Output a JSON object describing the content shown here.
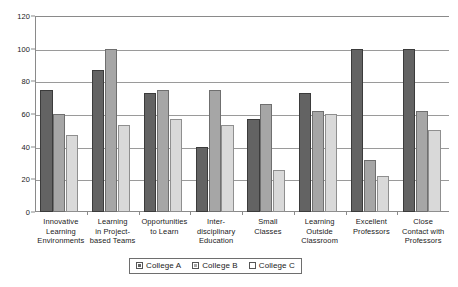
{
  "chart_data": {
    "type": "bar",
    "title": "",
    "subtitle": "",
    "xlabel": "",
    "ylabel": "",
    "ylim": [
      0,
      120
    ],
    "yticks": [
      0,
      20,
      40,
      60,
      80,
      100,
      120
    ],
    "grid": true,
    "legend_position": "bottom",
    "categories": [
      "Innovative Learning Environments",
      "Learning in Project-based Teams",
      "Opportunities to Learn",
      "Inter-disciplinary Education",
      "Small Classes",
      "Learning Outside Classroom",
      "Excellent Professors",
      "Close Contact with Professors"
    ],
    "category_lines": [
      [
        "Innovative",
        "Learning",
        "Environments"
      ],
      [
        "Learning",
        "in Project-",
        "based Teams"
      ],
      [
        "Opportunities",
        "to Learn"
      ],
      [
        "Inter-",
        "disciplinary",
        "Education"
      ],
      [
        "Small",
        "Classes"
      ],
      [
        "Learning",
        "Outside",
        "Classroom"
      ],
      [
        "Excellent",
        "Professors"
      ],
      [
        "Close",
        "Contact with",
        "Professors"
      ]
    ],
    "series": [
      {
        "name": "College A",
        "color": "#636363",
        "values": [
          75,
          87,
          73,
          40,
          57,
          73,
          100,
          100
        ]
      },
      {
        "name": "College B",
        "color": "#a6a6a6",
        "values": [
          60,
          100,
          75,
          75,
          66,
          62,
          32,
          62
        ]
      },
      {
        "name": "College C",
        "color": "#d9d9d9",
        "values": [
          47,
          53,
          57,
          53,
          26,
          60,
          22,
          50
        ]
      }
    ]
  },
  "legend": {
    "entries": [
      {
        "label": "College A"
      },
      {
        "label": "College B"
      },
      {
        "label": "College C"
      }
    ]
  }
}
